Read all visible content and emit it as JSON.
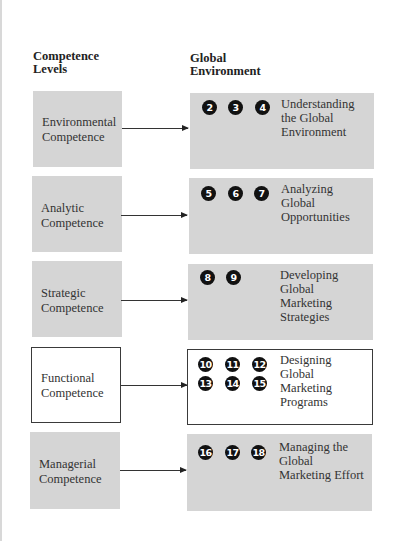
{
  "headers": {
    "left": [
      "Competence",
      "Levels"
    ],
    "right": [
      "Global",
      "Environment"
    ]
  },
  "rows": [
    {
      "competence": [
        "Environmental",
        "Competence"
      ],
      "style": "gray",
      "chapters": [
        "2",
        "3",
        "4"
      ],
      "environment": [
        "Understanding",
        "the Global",
        "Environment"
      ]
    },
    {
      "competence": [
        "Analytic",
        "Competence"
      ],
      "style": "gray",
      "chapters": [
        "5",
        "6",
        "7"
      ],
      "environment": [
        "Analyzing",
        "Global",
        "Opportunities"
      ]
    },
    {
      "competence": [
        "Strategic",
        "Competence"
      ],
      "style": "gray",
      "chapters": [
        "8",
        "9"
      ],
      "environment": [
        "Developing",
        "Global",
        "Marketing",
        "Strategies"
      ]
    },
    {
      "competence": [
        "Functional",
        "Competence"
      ],
      "style": "outline",
      "chapters": [
        "10",
        "11",
        "12",
        "13",
        "14",
        "15"
      ],
      "environment": [
        "Designing",
        "Global",
        "Marketing",
        "Programs"
      ]
    },
    {
      "competence": [
        "Managerial",
        "Competence"
      ],
      "style": "gray",
      "chapters": [
        "16",
        "17",
        "18"
      ],
      "environment": [
        "Managing the",
        "Global",
        "Marketing Effort"
      ]
    }
  ],
  "colors": {
    "box_fill": "#d5d5d5",
    "circle_fill": "#111111",
    "circle_text": "#ffffff",
    "outline": "#3a3a3a"
  }
}
